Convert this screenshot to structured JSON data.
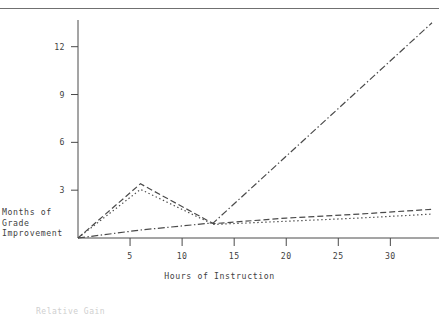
{
  "figure": {
    "background_color": "#ffffff",
    "ink_color": "#4a4a4a",
    "rule_color": "#707070"
  },
  "ylabel_line1": "Months of",
  "ylabel_line2": "Grade",
  "ylabel_line3": "Improvement",
  "xlabel": "Hours of Instruction",
  "yticks": [
    "3",
    "6",
    "9",
    "12"
  ],
  "xticks": [
    "5",
    "10",
    "15",
    "20",
    "25",
    "30"
  ],
  "footer": "Relative Gain",
  "chart_data": {
    "type": "line",
    "title": "",
    "xlabel": "Hours of Instruction",
    "ylabel": "Months of Grade Improvement",
    "xlim": [
      0,
      34
    ],
    "ylim": [
      0,
      13.8
    ],
    "xticks": [
      5,
      10,
      15,
      20,
      25,
      30
    ],
    "yticks": [
      3,
      6,
      9,
      12
    ],
    "grid": false,
    "legend": "none",
    "series": [
      {
        "name": "dashed-series",
        "style": "dashed",
        "color": "#4a4a4a",
        "x": [
          0,
          6,
          13,
          20,
          27,
          34
        ],
        "y": [
          0,
          3.4,
          0.9,
          1.25,
          1.5,
          1.8
        ]
      },
      {
        "name": "dotted-series",
        "style": "dotted",
        "color": "#4a4a4a",
        "x": [
          0,
          6,
          13,
          20,
          27,
          34
        ],
        "y": [
          0,
          3.05,
          0.85,
          1.05,
          1.25,
          1.5
        ]
      },
      {
        "name": "dash-dot-series",
        "style": "dash-dot",
        "color": "#4a4a4a",
        "x": [
          0,
          6,
          13,
          34
        ],
        "y": [
          0,
          0.5,
          0.95,
          13.5
        ]
      }
    ]
  }
}
